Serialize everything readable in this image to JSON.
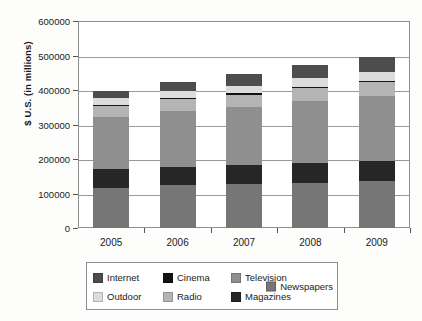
{
  "chart_data": {
    "type": "bar",
    "subtype": "stacked-bar",
    "title": "",
    "xlabel": "",
    "ylabel": "$ U.S. (in millions)",
    "categories": [
      "2005",
      "2006",
      "2007",
      "2008",
      "2009"
    ],
    "ylim": [
      0,
      600000
    ],
    "ytick_values": [
      0,
      100000,
      200000,
      300000,
      400000,
      500000,
      600000
    ],
    "ytick_labels": [
      "0",
      "100000",
      "200000",
      "300000",
      "400000",
      "500000",
      "600000"
    ],
    "grid": true,
    "legend_position": "bottom",
    "stack_order_bottom_to_top": [
      "Newspapers",
      "Magazines",
      "Television",
      "Radio",
      "Cinema",
      "Outdoor",
      "Internet"
    ],
    "series": [
      {
        "name": "Newspapers",
        "color": "#767676",
        "values": [
          117000,
          124000,
          127000,
          131000,
          136000
        ]
      },
      {
        "name": "Magazines",
        "color": "#262626",
        "values": [
          54000,
          53000,
          55000,
          57000,
          58000
        ]
      },
      {
        "name": "Television",
        "color": "#8f8f8f",
        "values": [
          150000,
          162000,
          168000,
          181000,
          188000
        ]
      },
      {
        "name": "Radio",
        "color": "#b4b4b4",
        "values": [
          33000,
          35000,
          37000,
          38000,
          40000
        ]
      },
      {
        "name": "Cinema",
        "color": "#131313",
        "values": [
          3000,
          3000,
          3000,
          3000,
          3000
        ]
      },
      {
        "name": "Outdoor",
        "color": "#dcdcdc",
        "values": [
          19000,
          21000,
          23000,
          25000,
          27000
        ]
      },
      {
        "name": "Internet",
        "color": "#4d4d4d",
        "values": [
          22000,
          26000,
          33000,
          39000,
          45000
        ]
      }
    ],
    "totals": [
      398000,
      424000,
      446000,
      474000,
      497000
    ]
  },
  "legend": {
    "entries": [
      {
        "label": "Internet",
        "color": "#4d4d4d"
      },
      {
        "label": "Cinema",
        "color": "#131313"
      },
      {
        "label": "Television",
        "color": "#8f8f8f"
      },
      {
        "label": "Outdoor",
        "color": "#dcdcdc"
      },
      {
        "label": "Radio",
        "color": "#b4b4b4"
      },
      {
        "label": "Magazines",
        "color": "#262626"
      },
      {
        "label": "Newspapers",
        "color": "#767676"
      }
    ]
  }
}
